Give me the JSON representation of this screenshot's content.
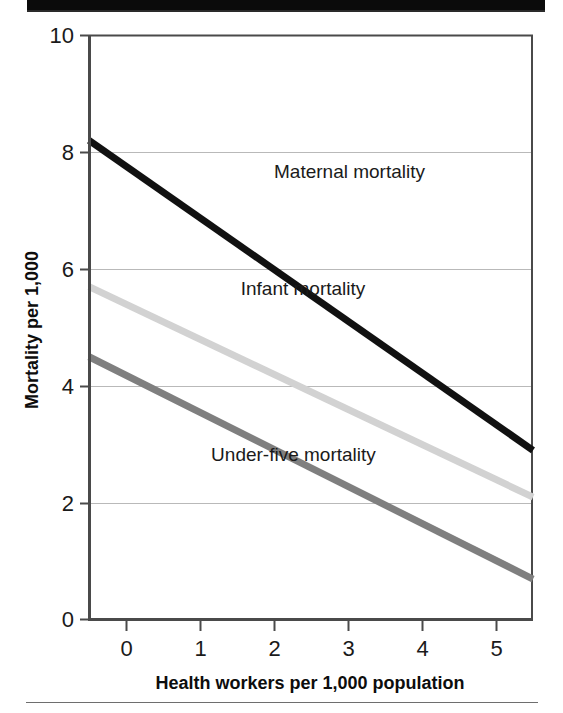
{
  "figure": {
    "top_bar_present": true,
    "bottom_rule_present": true
  },
  "chart_data": {
    "type": "line",
    "title": "",
    "subtitle": "",
    "xlabel": "Health workers per 1,000 population",
    "ylabel": "Mortality per 1,000",
    "xlim": [
      -0.5,
      5.5
    ],
    "ylim": [
      0,
      10
    ],
    "xticks": [
      0,
      1,
      2,
      3,
      4,
      5
    ],
    "xtick_labels": [
      "0",
      "1",
      "2",
      "3",
      "4",
      "5"
    ],
    "yticks": [
      0,
      2,
      4,
      6,
      8,
      10
    ],
    "ytick_labels": [
      "0",
      "2",
      "4",
      "6",
      "8",
      "10"
    ],
    "gridlines": {
      "horizontal": [
        2,
        4,
        6,
        8
      ],
      "vertical": []
    },
    "legend_position": "inline-annotations",
    "x": [
      -0.5,
      5.5
    ],
    "series": [
      {
        "name": "Maternal mortality",
        "label": "Maternal mortality",
        "color": "#111111",
        "width": 7,
        "values": [
          8.2,
          2.9
        ],
        "label_x": 2.0,
        "label_y": 7.55
      },
      {
        "name": "Infant mortality",
        "label": "Infant mortality",
        "color": "#d2d2d2",
        "width": 7,
        "values": [
          5.7,
          2.1
        ],
        "label_x": 1.55,
        "label_y": 5.55
      },
      {
        "name": "Under-five mortality",
        "label": "Under-five mortality",
        "color": "#7f7f7f",
        "width": 7,
        "values": [
          4.5,
          0.7
        ],
        "label_x": 1.15,
        "label_y": 2.72
      }
    ],
    "colors": {
      "axis": "#4a4a4a",
      "grid": "#b9b9b9",
      "text": "#1a1a1a",
      "background": "#ffffff"
    }
  }
}
